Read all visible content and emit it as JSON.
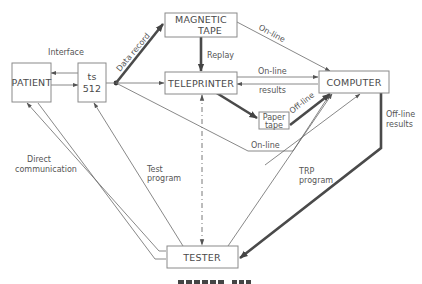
{
  "diagram": {
    "nodes": {
      "patient": "PATIENT",
      "ts512_line1": "ts",
      "ts512_line2": "512",
      "magnetic_tape_line1": "MAGNETIC",
      "magnetic_tape_line2": "TAPE",
      "teleprinter": "TELEPRINTER",
      "computer": "COMPUTER",
      "paper_tape_line1": "Paper",
      "paper_tape_line2": "tape",
      "tester": "TESTER"
    },
    "edge_labels": {
      "interface": "Interface",
      "data_record": "Data record",
      "replay": "Replay",
      "online_tape": "On-line",
      "online_teleprinter": "On-line",
      "results": "results",
      "offline_paper": "Off-line",
      "online_bottom": "On-line",
      "offline_results_line1": "Off-line",
      "offline_results_line2": "results",
      "direct_comm_line1": "Direct",
      "direct_comm_line2": "communication",
      "test_program_line1": "Test",
      "test_program_line2": "program",
      "trp_program_line1": "TRP",
      "trp_program_line2": "program"
    },
    "edges": [
      {
        "from": "ts512",
        "to": "patient",
        "style": "thin"
      },
      {
        "from": "patient",
        "to": "ts512",
        "style": "thin"
      },
      {
        "from": "ts512",
        "to": "magnetic_tape",
        "label": "Data record",
        "style": "thick"
      },
      {
        "from": "ts512",
        "to": "teleprinter",
        "style": "thin"
      },
      {
        "from": "ts512",
        "to": "computer",
        "label": "On-line",
        "style": "thin"
      },
      {
        "from": "magnetic_tape",
        "to": "teleprinter",
        "label": "Replay",
        "style": "thick"
      },
      {
        "from": "magnetic_tape",
        "to": "computer",
        "label": "On-line",
        "style": "thin"
      },
      {
        "from": "teleprinter",
        "to": "computer",
        "label": "On-line",
        "style": "thin"
      },
      {
        "from": "computer",
        "to": "teleprinter",
        "label": "results",
        "style": "thin"
      },
      {
        "from": "teleprinter",
        "to": "paper_tape",
        "style": "thick"
      },
      {
        "from": "paper_tape",
        "to": "computer",
        "label": "Off-line",
        "style": "thick"
      },
      {
        "from": "teleprinter",
        "to": "tester",
        "style": "dash-dot bidirectional"
      },
      {
        "from": "computer",
        "to": "tester",
        "label": "Off-line results",
        "style": "thick"
      },
      {
        "from": "tester",
        "to": "computer",
        "label": "TRP program",
        "style": "thin"
      },
      {
        "from": "tester",
        "to": "ts512",
        "label": "Test program",
        "style": "thin"
      },
      {
        "from": "tester",
        "to": "patient",
        "label": "Direct communication",
        "style": "thin"
      },
      {
        "from": "patient",
        "to": "tester",
        "style": "thin"
      }
    ]
  }
}
